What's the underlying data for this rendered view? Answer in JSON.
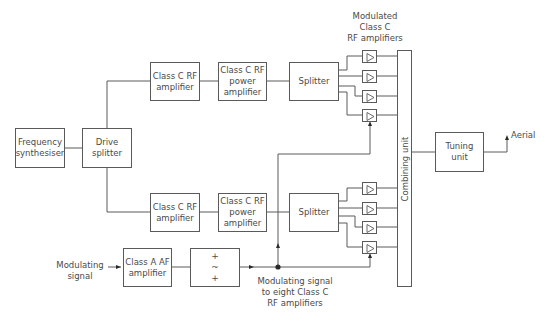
{
  "diagram": {
    "title": "",
    "type": "AM transmitter block diagram",
    "blocks": {
      "frequency_synthesiser": "Frequency\nsynthesiser",
      "drive_splitter": "Drive\nsplitter",
      "top_class_c_rf_amplifier": "Class C RF\namplifier",
      "top_class_c_rf_power_amplifier": "Class C RF\npower\namplifier",
      "top_splitter": "Splitter",
      "bottom_class_c_rf_amplifier": "Class C RF\namplifier",
      "bottom_class_c_rf_power_amplifier": "Class C RF\npower\namplifier",
      "bottom_splitter": "Splitter",
      "combining_unit": "Combining unit",
      "tuning_unit": "Tuning\nunit",
      "class_a_af_amplifier": "Class A AF\namplifier",
      "filter_symbols": [
        "+",
        "~",
        "+"
      ]
    },
    "labels": {
      "modulated_amplifiers": "Modulated\nClass C\nRF amplifiers",
      "aerial": "Aerial",
      "modulating_signal": "Modulating\nsignal",
      "modulating_to_eight": "Modulating signal\nto eight Class C\nRF amplifiers"
    },
    "amplifier_count": 8,
    "colors": {
      "line": "#5a5a5a",
      "text": "#4a4a4a",
      "background": "#ffffff"
    }
  }
}
